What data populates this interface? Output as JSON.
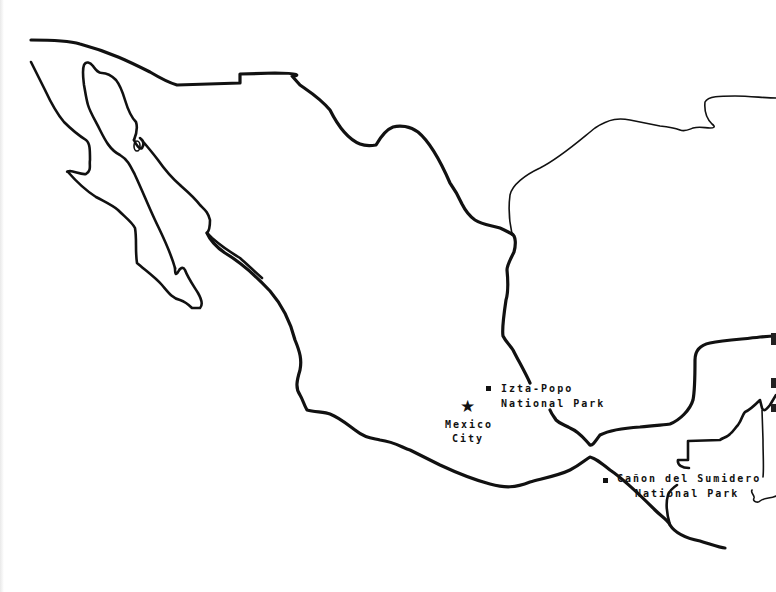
{
  "map": {
    "title": "Outline map of Mexico",
    "background": "#ffffff",
    "line_color": "#111111",
    "markers": [
      {
        "id": "izta-popo",
        "type": "square",
        "line1": "Izta-Popo",
        "line2": "National Park"
      },
      {
        "id": "mexico-city",
        "type": "star",
        "icon": "★",
        "line1": "Mexico",
        "line2": "City"
      },
      {
        "id": "canon-del-sumidero",
        "type": "square",
        "line1": "Cañon del Sumidero",
        "line2": "National Park"
      }
    ]
  }
}
